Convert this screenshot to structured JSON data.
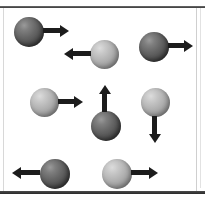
{
  "figure": {
    "type": "physics-vector-diagram",
    "background_color": "#ffffff",
    "frame_color": "#3a3a3a",
    "ball_dark_color": "#4e4e4e",
    "ball_light_color": "#b2b2b2",
    "arrow_color": "#1c1c1c",
    "object_count": 8
  },
  "objects": [
    {
      "id": "object-1",
      "shade": "dark",
      "direction": "right",
      "row": 1,
      "ball": {
        "x": 14,
        "y": 17,
        "d": 30
      },
      "arrow": {
        "x": 43,
        "y": 28,
        "length": 26,
        "thickness": 5
      }
    },
    {
      "id": "object-2",
      "shade": "light",
      "direction": "left",
      "row": 1,
      "ball": {
        "x": 90,
        "y": 40,
        "d": 29
      },
      "arrow": {
        "x": 64,
        "y": 51,
        "length": 27,
        "thickness": 5
      }
    },
    {
      "id": "object-3",
      "shade": "dark",
      "direction": "right",
      "row": 1,
      "ball": {
        "x": 139,
        "y": 32,
        "d": 30
      },
      "arrow": {
        "x": 168,
        "y": 43,
        "length": 25,
        "thickness": 5
      }
    },
    {
      "id": "object-4",
      "shade": "light",
      "direction": "right",
      "row": 2,
      "ball": {
        "x": 30,
        "y": 88,
        "d": 29
      },
      "arrow": {
        "x": 58,
        "y": 99,
        "length": 25,
        "thickness": 5
      }
    },
    {
      "id": "object-5",
      "shade": "dark",
      "direction": "up",
      "row": 2,
      "ball": {
        "x": 91,
        "y": 111,
        "d": 30
      },
      "arrow": {
        "x": 102,
        "y": 85,
        "length": 27,
        "thickness": 5
      }
    },
    {
      "id": "object-6",
      "shade": "light",
      "direction": "down",
      "row": 2,
      "ball": {
        "x": 141,
        "y": 88,
        "d": 29
      },
      "arrow": {
        "x": 152,
        "y": 116,
        "length": 27,
        "thickness": 5
      }
    },
    {
      "id": "object-7",
      "shade": "dark",
      "direction": "left",
      "row": 3,
      "ball": {
        "x": 40,
        "y": 159,
        "d": 30
      },
      "arrow": {
        "x": 12,
        "y": 170,
        "length": 28,
        "thickness": 5
      }
    },
    {
      "id": "object-8",
      "shade": "light",
      "direction": "right",
      "row": 3,
      "ball": {
        "x": 102,
        "y": 159,
        "d": 30
      },
      "arrow": {
        "x": 131,
        "y": 170,
        "length": 27,
        "thickness": 5
      }
    }
  ]
}
